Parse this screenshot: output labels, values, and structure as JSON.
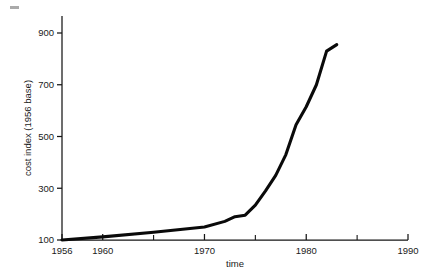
{
  "chart_data": {
    "type": "line",
    "title": "",
    "xlabel": "time",
    "ylabel": "cost index (1956 base)",
    "xlim": [
      1954,
      1990
    ],
    "ylim": [
      100,
      960
    ],
    "grid": false,
    "legend": null,
    "xticks": [
      1956,
      1960,
      1970,
      1980,
      1990
    ],
    "xtick_labels": [
      "1956",
      "1960",
      "1970",
      "1980",
      "1990"
    ],
    "xticks_minor": [
      1965,
      1975,
      1985
    ],
    "yticks": [
      100,
      300,
      500,
      700,
      900
    ],
    "ytick_labels": [
      "100",
      "300",
      "500",
      "700",
      "900"
    ],
    "series": [
      {
        "name": "cost index",
        "color": "#0a0a0a",
        "x": [
          1956,
          1960,
          1965,
          1970,
          1972,
          1973,
          1974,
          1975,
          1976,
          1977,
          1978,
          1979,
          1980,
          1981,
          1982,
          1983
        ],
        "values": [
          100,
          112,
          130,
          150,
          172,
          190,
          196,
          235,
          290,
          350,
          430,
          545,
          615,
          700,
          830,
          855
        ]
      }
    ]
  },
  "axis_titles": {
    "x": "time",
    "y": "cost index (1956 base)"
  },
  "colors": {
    "line": "#0a0a0a",
    "axis": "#151515",
    "background": "#ffffff"
  }
}
